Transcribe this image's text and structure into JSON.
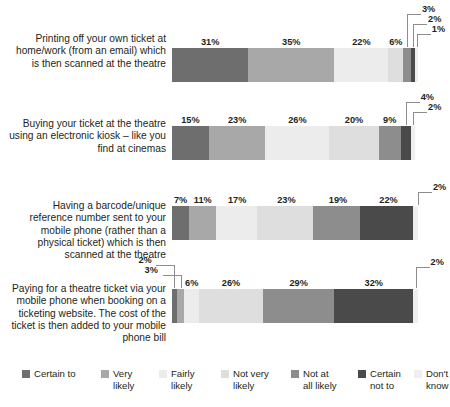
{
  "chart_data": {
    "type": "bar",
    "orientation": "horizontal",
    "stacked": true,
    "title": "",
    "xlabel": "",
    "ylabel": "",
    "xlim": [
      0,
      100
    ],
    "grid": false,
    "legend_position": "bottom",
    "value_suffix": "%",
    "categories": [
      "Printing off your own ticket at home/work (from an email) which is then scanned at the theatre",
      "Buying your ticket at the theatre using an electronic kiosk – like you find at cinemas",
      "Having a barcode/unique reference number sent to your mobile phone (rather than a physical ticket) which is then scanned at the theatre",
      "Paying for a theatre ticket via your mobile phone when booking on a ticketing website. The cost of the ticket is then added to your mobile phone bill"
    ],
    "series": [
      {
        "name": "Certain to",
        "color": "#6e6e6e",
        "values": [
          31,
          15,
          7,
          2
        ]
      },
      {
        "name": "Very likely",
        "color": "#a8a8a8",
        "values": [
          35,
          23,
          11,
          3
        ]
      },
      {
        "name": "Fairly likely",
        "color": "#ececec",
        "values": [
          22,
          26,
          17,
          6
        ]
      },
      {
        "name": "Not very likely",
        "color": "#dedede",
        "values": [
          6,
          20,
          23,
          26
        ]
      },
      {
        "name": "Not at all likely",
        "color": "#8d8d8d",
        "values": [
          3,
          9,
          19,
          29
        ]
      },
      {
        "name": "Certain not to",
        "color": "#4a4a4a",
        "values": [
          2,
          4,
          22,
          32
        ]
      },
      {
        "name": "Don't know",
        "color": "#efefef",
        "values": [
          1,
          2,
          2,
          2
        ]
      }
    ]
  },
  "rows": [
    {
      "label": "Printing off your own ticket at home/work (from an email) which is then scanned at the theatre",
      "segments": [
        {
          "name": "Certain to",
          "value": 31,
          "label": "31%",
          "color": "#6e6e6e",
          "label_mode": "inside"
        },
        {
          "name": "Very likely",
          "value": 35,
          "label": "35%",
          "color": "#a8a8a8",
          "label_mode": "inside"
        },
        {
          "name": "Fairly likely",
          "value": 22,
          "label": "22%",
          "color": "#ececec",
          "label_mode": "inside"
        },
        {
          "name": "Not very likely",
          "value": 6,
          "label": "6%",
          "color": "#dedede",
          "label_mode": "inside"
        },
        {
          "name": "Not at all likely",
          "value": 3,
          "label": "3%",
          "color": "#8d8d8d",
          "label_mode": "callout"
        },
        {
          "name": "Certain not to",
          "value": 2,
          "label": "2%",
          "color": "#4a4a4a",
          "label_mode": "callout"
        },
        {
          "name": "Don't know",
          "value": 1,
          "label": "1%",
          "color": "#efefef",
          "label_mode": "callout"
        }
      ]
    },
    {
      "label": "Buying your ticket at the theatre using an electronic kiosk – like you find at cinemas",
      "segments": [
        {
          "name": "Certain to",
          "value": 15,
          "label": "15%",
          "color": "#6e6e6e",
          "label_mode": "inside"
        },
        {
          "name": "Very likely",
          "value": 23,
          "label": "23%",
          "color": "#a8a8a8",
          "label_mode": "inside"
        },
        {
          "name": "Fairly likely",
          "value": 26,
          "label": "26%",
          "color": "#ececec",
          "label_mode": "inside"
        },
        {
          "name": "Not very likely",
          "value": 20,
          "label": "20%",
          "color": "#dedede",
          "label_mode": "inside"
        },
        {
          "name": "Not at all likely",
          "value": 9,
          "label": "9%",
          "color": "#8d8d8d",
          "label_mode": "inside"
        },
        {
          "name": "Certain not to",
          "value": 4,
          "label": "4%",
          "color": "#4a4a4a",
          "label_mode": "callout"
        },
        {
          "name": "Don't know",
          "value": 2,
          "label": "2%",
          "color": "#efefef",
          "label_mode": "callout"
        }
      ]
    },
    {
      "label": "Having a barcode/unique reference number sent to your mobile phone (rather than a physical ticket) which is then scanned at the theatre",
      "segments": [
        {
          "name": "Certain to",
          "value": 7,
          "label": "7%",
          "color": "#6e6e6e",
          "label_mode": "inside"
        },
        {
          "name": "Very likely",
          "value": 11,
          "label": "11%",
          "color": "#a8a8a8",
          "label_mode": "inside"
        },
        {
          "name": "Fairly likely",
          "value": 17,
          "label": "17%",
          "color": "#ececec",
          "label_mode": "inside"
        },
        {
          "name": "Not very likely",
          "value": 23,
          "label": "23%",
          "color": "#dedede",
          "label_mode": "inside"
        },
        {
          "name": "Not at all likely",
          "value": 19,
          "label": "19%",
          "color": "#8d8d8d",
          "label_mode": "inside"
        },
        {
          "name": "Certain not to",
          "value": 22,
          "label": "22%",
          "color": "#4a4a4a",
          "label_mode": "inside"
        },
        {
          "name": "Don't know",
          "value": 2,
          "label": "2%",
          "color": "#efefef",
          "label_mode": "callout"
        }
      ]
    },
    {
      "label": "Paying for a theatre ticket via your mobile phone when booking on a ticketing website. The cost of the ticket is then added to your mobile phone bill",
      "segments": [
        {
          "name": "Certain to",
          "value": 2,
          "label": "2%",
          "color": "#6e6e6e",
          "label_mode": "callout"
        },
        {
          "name": "Very likely",
          "value": 3,
          "label": "3%",
          "color": "#a8a8a8",
          "label_mode": "callout"
        },
        {
          "name": "Fairly likely",
          "value": 6,
          "label": "6%",
          "color": "#ececec",
          "label_mode": "inside"
        },
        {
          "name": "Not very likely",
          "value": 26,
          "label": "26%",
          "color": "#dedede",
          "label_mode": "inside"
        },
        {
          "name": "Not at all likely",
          "value": 29,
          "label": "29%",
          "color": "#8d8d8d",
          "label_mode": "inside"
        },
        {
          "name": "Certain not to",
          "value": 32,
          "label": "32%",
          "color": "#4a4a4a",
          "label_mode": "inside"
        },
        {
          "name": "Don't know",
          "value": 2,
          "label": "2%",
          "color": "#efefef",
          "label_mode": "callout"
        }
      ]
    }
  ],
  "legend": {
    "items": [
      {
        "label": "Certain to",
        "color": "#6e6e6e"
      },
      {
        "label": "Very\nlikely",
        "color": "#a8a8a8"
      },
      {
        "label": "Fairly\nlikely",
        "color": "#ececec"
      },
      {
        "label": "Not very\nlikely",
        "color": "#dedede"
      },
      {
        "label": "Not at\nall likely",
        "color": "#8d8d8d"
      },
      {
        "label": "Certain\nnot to",
        "color": "#4a4a4a"
      },
      {
        "label": "Don't\nknow",
        "color": "#efefef"
      }
    ]
  }
}
